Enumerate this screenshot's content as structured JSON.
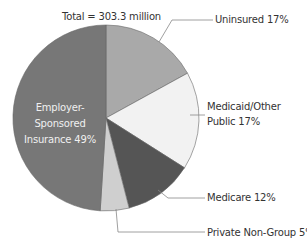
{
  "chart_data": {
    "type": "pie",
    "title": "",
    "subtitle": "Total = 303.3 million",
    "categories": [
      "Uninsured",
      "Medicaid/Other Public",
      "Medicare",
      "Private Non-Group",
      "Employer-Sponsored Insurance"
    ],
    "values": [
      17,
      17,
      12,
      5,
      49
    ],
    "unit": "%",
    "labels": [
      "Uninsured 17%",
      "Medicaid/Other Public 17%",
      "Medicare 12%",
      "Private Non-Group 5%",
      "Employer-Sponsored Insurance 49%"
    ],
    "colors": [
      "#a9a9a9",
      "#f2f2f2",
      "#555555",
      "#cfcfcf",
      "#777777"
    ],
    "start_angle": "top, clockwise",
    "legend": "none (leader-line labels)"
  },
  "subtitle": "Total = 303.3 million",
  "labels": {
    "uninsured": "Uninsured 17%",
    "medicaid_line1": "Medicaid/Other",
    "medicaid_line2": "Public 17%",
    "medicare": "Medicare 12%",
    "private": "Private Non-Group 5%",
    "employer_line1": "Employer-",
    "employer_line2": "Sponsored",
    "employer_line3": "Insurance 49%"
  }
}
